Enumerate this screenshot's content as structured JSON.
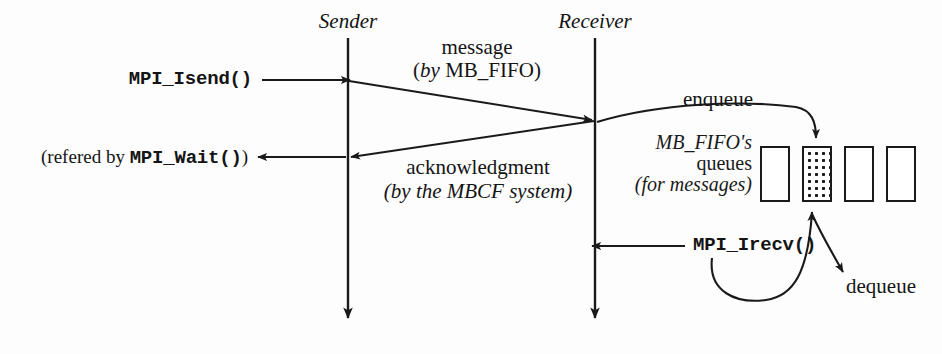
{
  "figure": {
    "background_color": "#fdfdfd",
    "ink_color": "#1a1a1a"
  },
  "lifelines": [
    {
      "name": "sender",
      "label": "Sender",
      "x": 348,
      "y_top": 38,
      "y_bottom": 322
    },
    {
      "name": "receiver",
      "label": "Receiver",
      "x": 595,
      "y_top": 38,
      "y_bottom": 322
    }
  ],
  "calls": {
    "isend": "MPI_Isend()",
    "wait": "(refered by MPI_Wait())",
    "irecv": "MPI_Irecv()"
  },
  "messages": {
    "send": {
      "line1": "message",
      "line2": "(by MB_FIFO)"
    },
    "ack": {
      "line1": "acknowledgment",
      "line2": "(by the MBCF system)"
    }
  },
  "queue": {
    "caption_line1": "MB_FIFO's",
    "caption_line2": "queues",
    "caption_line3": "(for messages)",
    "enqueue_label": "enqueue",
    "dequeue_label": "dequeue",
    "boxes": [
      {
        "index": 1,
        "filled": false,
        "x": 760,
        "y": 146,
        "w": 30,
        "h": 56
      },
      {
        "index": 2,
        "filled": true,
        "x": 802,
        "y": 146,
        "w": 30,
        "h": 56
      },
      {
        "index": 3,
        "filled": false,
        "x": 844,
        "y": 146,
        "w": 30,
        "h": 56
      },
      {
        "index": 4,
        "filled": false,
        "x": 886,
        "y": 146,
        "w": 30,
        "h": 56
      }
    ]
  }
}
